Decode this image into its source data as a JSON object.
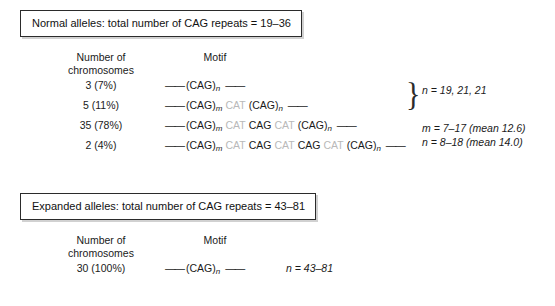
{
  "figure": {
    "sections": [
      {
        "id": "normal",
        "title": "Normal alleles: total number of CAG repeats = 19–36",
        "headers": {
          "count_line1": "Number of",
          "count_line2": "chromosomes",
          "motif": "Motif"
        },
        "rows": [
          {
            "count": "3 (7%)",
            "tokens": [
              {
                "t": "dash",
                "v": "——"
              },
              {
                "t": "cag",
                "v": "(CAG)",
                "sub": "n"
              },
              {
                "t": "dash",
                "v": "——"
              }
            ]
          },
          {
            "count": "5 (11%)",
            "tokens": [
              {
                "t": "dash",
                "v": "——"
              },
              {
                "t": "cag",
                "v": "(CAG)",
                "sub": "m"
              },
              {
                "t": "cat",
                "v": "CAT"
              },
              {
                "t": "cag",
                "v": "(CAG)",
                "sub": "n"
              },
              {
                "t": "dash",
                "v": "——"
              }
            ]
          },
          {
            "count": "35 (78%)",
            "tokens": [
              {
                "t": "dash",
                "v": "——"
              },
              {
                "t": "cag",
                "v": "(CAG)",
                "sub": "m"
              },
              {
                "t": "cat",
                "v": "CAT"
              },
              {
                "t": "cag",
                "v": "CAG"
              },
              {
                "t": "cat",
                "v": "CAT"
              },
              {
                "t": "cag",
                "v": "(CAG)",
                "sub": "n"
              },
              {
                "t": "dash",
                "v": "——"
              }
            ]
          },
          {
            "count": "2 (4%)",
            "tokens": [
              {
                "t": "dash",
                "v": "——"
              },
              {
                "t": "cag",
                "v": "(CAG)",
                "sub": "m"
              },
              {
                "t": "cat",
                "v": "CAT"
              },
              {
                "t": "cag",
                "v": "CAG"
              },
              {
                "t": "cat",
                "v": "CAT"
              },
              {
                "t": "cag",
                "v": "CAG"
              },
              {
                "t": "cat",
                "v": "CAT"
              },
              {
                "t": "cag",
                "v": "(CAG)",
                "sub": "n"
              },
              {
                "t": "dash",
                "v": "——"
              }
            ]
          }
        ],
        "brace": "}",
        "annotation_top": "n = 19, 21, 21",
        "annotation_bottom_line1": "m = 7–17 (mean 12.6)",
        "annotation_bottom_line2": "n = 8–18 (mean 14.0)"
      },
      {
        "id": "expanded",
        "title": "Expanded alleles: total number of CAG repeats = 43–81",
        "headers": {
          "count_line1": "Number of",
          "count_line2": "chromosomes",
          "motif": "Motif"
        },
        "rows": [
          {
            "count": "30 (100%)",
            "tokens": [
              {
                "t": "dash",
                "v": "——"
              },
              {
                "t": "cag",
                "v": "(CAG)",
                "sub": "n"
              },
              {
                "t": "dash",
                "v": "——"
              }
            ],
            "annotation": "n = 43–81"
          }
        ]
      }
    ],
    "colors": {
      "cag_text": "#1a1a1a",
      "cat_text": "#b9b9b9",
      "box_border": "#2b2b2b",
      "background": "#ffffff"
    }
  }
}
